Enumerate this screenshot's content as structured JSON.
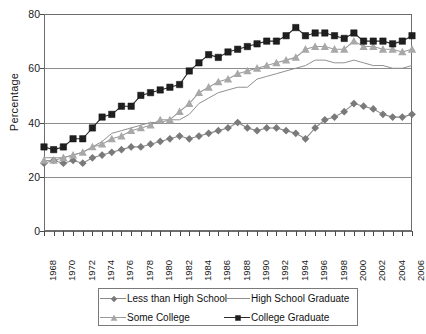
{
  "chart_data": {
    "type": "line",
    "title": "",
    "xlabel": "",
    "ylabel": "Percentage",
    "ylim": [
      0,
      80
    ],
    "ytick_values": [
      0,
      20,
      40,
      60,
      80
    ],
    "grid": "horizontal",
    "legend_position": "bottom",
    "x": [
      1968,
      1969,
      1970,
      1971,
      1972,
      1973,
      1974,
      1975,
      1976,
      1977,
      1978,
      1979,
      1980,
      1981,
      1982,
      1983,
      1984,
      1985,
      1986,
      1987,
      1988,
      1989,
      1990,
      1991,
      1992,
      1993,
      1994,
      1995,
      1996,
      1997,
      1998,
      1999,
      2000,
      2001,
      2002,
      2003,
      2004,
      2005,
      2006
    ],
    "xtick_labels": [
      "1968",
      "1970",
      "1972",
      "1974",
      "1976",
      "1978",
      "1980",
      "1982",
      "1984",
      "1986",
      "1988",
      "1990",
      "1992",
      "1994",
      "1996",
      "1998",
      "2000",
      "2002",
      "2004",
      "2006"
    ],
    "xlim": [
      1968,
      2006
    ],
    "series": [
      {
        "name": "Less than High School",
        "marker": "diamond",
        "color": "#7a7a7a",
        "line_color": "#8a8a8a",
        "values": [
          25,
          26,
          25,
          26,
          25,
          27,
          28,
          29,
          30,
          31,
          31,
          32,
          33,
          34,
          35,
          34,
          35,
          36,
          37,
          38,
          40,
          38,
          37,
          38,
          38,
          37,
          36,
          34,
          38,
          41,
          42,
          44,
          47,
          46,
          45,
          43,
          42,
          42,
          43
        ]
      },
      {
        "name": "High School Graduate",
        "marker": "none",
        "color": "#8c8c8c",
        "line_color": "#909090",
        "values": [
          27,
          27,
          27,
          28,
          29,
          31,
          33,
          36,
          37,
          38,
          39,
          40,
          40,
          41,
          41,
          43,
          47,
          49,
          51,
          52,
          53,
          53,
          56,
          57,
          58,
          59,
          60,
          61,
          63,
          63,
          62,
          62,
          63,
          62,
          61,
          61,
          60,
          60,
          61
        ]
      },
      {
        "name": "Some College",
        "marker": "triangle",
        "color": "#a8a8a8",
        "line_color": "#9a9a9a",
        "values": [
          26,
          26,
          27,
          28,
          29,
          31,
          32,
          34,
          35,
          37,
          38,
          39,
          41,
          41,
          44,
          47,
          51,
          53,
          55,
          56,
          58,
          59,
          60,
          61,
          62,
          63,
          64,
          67,
          68,
          68,
          67,
          67,
          70,
          68,
          68,
          67,
          67,
          66,
          67
        ]
      },
      {
        "name": "College Graduate",
        "marker": "square",
        "color": "#1f1f1f",
        "line_color": "#2b2b2b",
        "values": [
          31,
          30,
          31,
          34,
          34,
          38,
          42,
          43,
          46,
          46,
          50,
          51,
          52,
          53,
          54,
          59,
          62,
          65,
          64,
          66,
          67,
          68,
          69,
          70,
          70,
          72,
          75,
          72,
          73,
          73,
          72,
          71,
          73,
          70,
          70,
          70,
          69,
          70,
          72
        ]
      }
    ]
  },
  "legend": {
    "items": [
      {
        "label": "Less than High School",
        "marker": "diamond"
      },
      {
        "label": "High School Graduate",
        "marker": "none"
      },
      {
        "label": "Some College",
        "marker": "triangle"
      },
      {
        "label": "College Graduate",
        "marker": "square"
      }
    ]
  },
  "axis": {
    "y_title": "Percentage"
  }
}
